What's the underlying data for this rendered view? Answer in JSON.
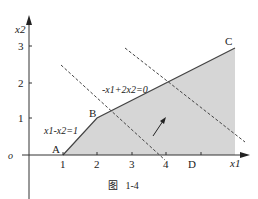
{
  "figure": {
    "caption": "图   1-4",
    "y_axis_label": "x2",
    "x_axis_label": "x1",
    "origin_label": "o",
    "x_ticks": [
      "1",
      "2",
      "3",
      "4"
    ],
    "y_ticks": [
      "1",
      "2",
      "3"
    ],
    "points": {
      "A": "A",
      "B": "B",
      "C": "C",
      "D": "D"
    },
    "line_labels": {
      "constraint": "x1-x2=1",
      "objective": "-x1+2x2=0"
    },
    "colors": {
      "feasible_fill": "#d6d6d6",
      "axis": "#333333",
      "line": "#444444"
    }
  }
}
